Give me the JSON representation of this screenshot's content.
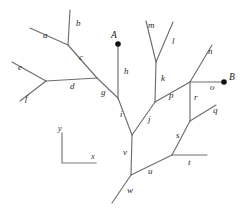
{
  "figure": {
    "background_color": "#ffffff",
    "branch_color": "#6e6e6e",
    "label_color": "#2b2b2b",
    "point_color": "#111111",
    "width": 242,
    "height": 210
  },
  "points": [
    {
      "id": "A",
      "label": "A",
      "x": 118,
      "y": 44,
      "label_x": 111,
      "label_y": 38
    },
    {
      "id": "B",
      "label": "B",
      "x": 224,
      "y": 82,
      "label_x": 229,
      "label_y": 80
    }
  ],
  "axes": {
    "origin_x": 62,
    "origin_y": 163,
    "x_label": "x",
    "y_label": "y",
    "x_end_x": 96,
    "x_end_y": 163,
    "y_end_x": 62,
    "y_end_y": 133,
    "x_label_x": 91,
    "x_label_y": 159,
    "y_label_x": 58,
    "y_label_y": 131
  },
  "branches": [
    {
      "id": "a",
      "label": "a",
      "x1": 30,
      "y1": 28,
      "x2": 68,
      "y2": 45,
      "label_x": 43,
      "label_y": 38
    },
    {
      "id": "b",
      "label": "b",
      "x1": 70,
      "y1": 10,
      "x2": 68,
      "y2": 45,
      "label_x": 76,
      "label_y": 26
    },
    {
      "id": "c",
      "label": "c",
      "x1": 68,
      "y1": 45,
      "x2": 97,
      "y2": 78,
      "label_x": 79,
      "label_y": 60
    },
    {
      "id": "d",
      "label": "d",
      "x1": 46,
      "y1": 81,
      "x2": 97,
      "y2": 78,
      "label_x": 70,
      "label_y": 89
    },
    {
      "id": "e",
      "label": "e",
      "x1": 12,
      "y1": 62,
      "x2": 46,
      "y2": 81,
      "label_x": 18,
      "label_y": 70
    },
    {
      "id": "f",
      "label": "f",
      "x1": 20,
      "y1": 101,
      "x2": 46,
      "y2": 81,
      "label_x": 25,
      "label_y": 101
    },
    {
      "id": "g",
      "label": "g",
      "x1": 97,
      "y1": 78,
      "x2": 118,
      "y2": 98,
      "label_x": 101,
      "label_y": 95
    },
    {
      "id": "h",
      "label": "h",
      "x1": 118,
      "y1": 44,
      "x2": 118,
      "y2": 98,
      "label_x": 124,
      "label_y": 74
    },
    {
      "id": "i",
      "label": "i",
      "x1": 118,
      "y1": 98,
      "x2": 132,
      "y2": 135,
      "label_x": 120,
      "label_y": 117
    },
    {
      "id": "j",
      "label": "j",
      "x1": 132,
      "y1": 135,
      "x2": 155,
      "y2": 102,
      "label_x": 148,
      "label_y": 122
    },
    {
      "id": "k",
      "label": "k",
      "x1": 156,
      "y1": 62,
      "x2": 155,
      "y2": 102,
      "label_x": 161,
      "label_y": 81
    },
    {
      "id": "l",
      "label": "l",
      "x1": 173,
      "y1": 22,
      "x2": 156,
      "y2": 62,
      "label_x": 172,
      "label_y": 44
    },
    {
      "id": "m",
      "label": "m",
      "x1": 146,
      "y1": 21,
      "x2": 156,
      "y2": 62,
      "label_x": 148,
      "label_y": 28
    },
    {
      "id": "n",
      "label": "n",
      "x1": 212,
      "y1": 45,
      "x2": 190,
      "y2": 82,
      "label_x": 208,
      "label_y": 54
    },
    {
      "id": "o",
      "label": "o",
      "x1": 190,
      "y1": 82,
      "x2": 224,
      "y2": 82,
      "label_x": 210,
      "label_y": 90
    },
    {
      "id": "p",
      "label": "p",
      "x1": 155,
      "y1": 102,
      "x2": 190,
      "y2": 82,
      "label_x": 169,
      "label_y": 98
    },
    {
      "id": "q",
      "label": "q",
      "x1": 216,
      "y1": 105,
      "x2": 190,
      "y2": 121,
      "label_x": 213,
      "label_y": 113
    },
    {
      "id": "r",
      "label": "r",
      "x1": 190,
      "y1": 82,
      "x2": 190,
      "y2": 121,
      "label_x": 194,
      "label_y": 100
    },
    {
      "id": "s",
      "label": "s",
      "x1": 190,
      "y1": 121,
      "x2": 172,
      "y2": 155,
      "label_x": 176,
      "label_y": 138
    },
    {
      "id": "t",
      "label": "t",
      "x1": 172,
      "y1": 155,
      "x2": 207,
      "y2": 155,
      "label_x": 188,
      "label_y": 165
    },
    {
      "id": "u",
      "label": "u",
      "x1": 131,
      "y1": 175,
      "x2": 172,
      "y2": 155,
      "label_x": 148,
      "label_y": 174
    },
    {
      "id": "v",
      "label": "v",
      "x1": 132,
      "y1": 135,
      "x2": 131,
      "y2": 175,
      "label_x": 123,
      "label_y": 155
    },
    {
      "id": "w",
      "label": "w",
      "x1": 112,
      "y1": 203,
      "x2": 131,
      "y2": 175,
      "label_x": 127,
      "label_y": 193
    }
  ]
}
